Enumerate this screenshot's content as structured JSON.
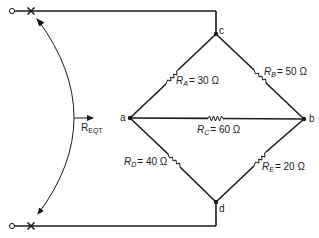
{
  "diagram": {
    "type": "bridge-circuit",
    "nodes": {
      "a": {
        "label": "a"
      },
      "b": {
        "label": "b"
      },
      "c": {
        "label": "c"
      },
      "d": {
        "label": "d"
      }
    },
    "equivalent": {
      "label_main": "R",
      "label_sub": "EQT"
    },
    "resistors": [
      {
        "id": "RA",
        "name": "R",
        "sub": "A",
        "value": "= 30 Ω",
        "between": "a-c"
      },
      {
        "id": "RB",
        "name": "R",
        "sub": "B",
        "value": "= 50 Ω",
        "between": "c-b"
      },
      {
        "id": "RC",
        "name": "R",
        "sub": "C",
        "value": "= 60 Ω",
        "between": "a-b"
      },
      {
        "id": "RD",
        "name": "R",
        "sub": "D",
        "value": "= 40 Ω",
        "between": "a-d"
      },
      {
        "id": "RE",
        "name": "R",
        "sub": "E",
        "value": "= 20 Ω",
        "between": "d-b"
      }
    ],
    "terminals": [
      {
        "id": "top-terminal",
        "marker": "×"
      },
      {
        "id": "bottom-terminal",
        "marker": "×"
      }
    ]
  }
}
